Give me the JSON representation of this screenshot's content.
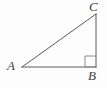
{
  "figure": {
    "kind": "geometry-diagram",
    "background_color": "#fdfdfd",
    "stroke_color": "#5a5a5a",
    "label_color": "#3f3f3f",
    "stroke_width": 1,
    "canvas": {
      "width": 107,
      "height": 88
    },
    "vertices": [
      {
        "name": "A",
        "label": "A",
        "x": 22,
        "y": 67,
        "label_x": 7,
        "label_y": 59
      },
      {
        "name": "B",
        "label": "B",
        "x": 96,
        "y": 67,
        "label_x": 88,
        "label_y": 69
      },
      {
        "name": "C",
        "label": "C",
        "x": 96,
        "y": 14,
        "label_x": 89,
        "label_y": 0
      }
    ],
    "edges": [
      {
        "name": "AB",
        "from": "A",
        "to": "B",
        "x1": 22,
        "y1": 67,
        "x2": 96,
        "y2": 67
      },
      {
        "name": "BC",
        "from": "B",
        "to": "C",
        "x1": 96,
        "y1": 67,
        "x2": 96,
        "y2": 14
      },
      {
        "name": "CA",
        "from": "C",
        "to": "A",
        "x1": 96,
        "y1": 14,
        "x2": 22,
        "y2": 67
      }
    ],
    "right_angle_marker": {
      "at_vertex": "B",
      "size": 11,
      "x": 85,
      "y": 56,
      "width": 11,
      "height": 11
    }
  }
}
